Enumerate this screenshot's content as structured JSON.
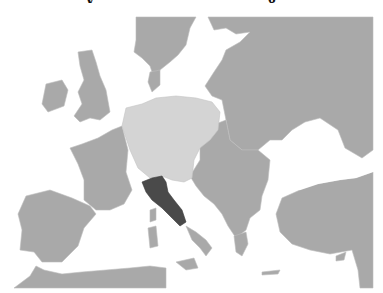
{
  "map": {
    "subject": "Europe political map",
    "colors": {
      "water": "#ffffff",
      "land": "#a9a9a9",
      "border": "#bdbdbd",
      "highlight_light": "#d4d4d4",
      "highlight_dark": "#4a4a4a"
    },
    "regions": [
      {
        "name": "Central Europe region",
        "shade": "light"
      },
      {
        "name": "Central Italy region",
        "shade": "dark"
      },
      {
        "name": "Other land",
        "shade": "medium"
      }
    ]
  },
  "title_fragment": {
    "left_glyph": "y",
    "right_glyph": "g"
  }
}
